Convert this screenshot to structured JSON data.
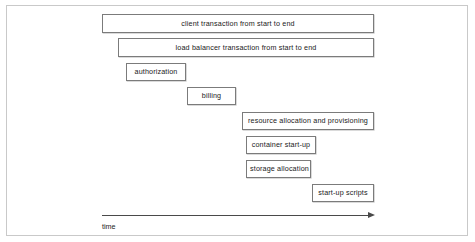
{
  "figure": {
    "type": "gantt-timeline",
    "background_color": "#ffffff",
    "frame_color": "#c9c9c9",
    "bar_border_color": "#7b7b7b",
    "bar_fill_color": "#ffffff",
    "text_color": "#1a1a1a",
    "axis_color": "#4a4a4a"
  },
  "chart_data": {
    "type": "bar",
    "orientation": "horizontal",
    "title": "",
    "xlabel": "time",
    "ylabel": "",
    "grid": false,
    "legend": false,
    "axis": {
      "label": "time",
      "arrow": true,
      "direction": "right",
      "x_start_px": 102,
      "x_end_px": 374,
      "y_px": 215
    },
    "categories": [
      "client transaction from start to end",
      "load balancer transaction from start to end",
      "authorization",
      "billing",
      "resource allocation and provisioning",
      "container start-up",
      "storage allocation",
      "start-up scripts"
    ],
    "bars": [
      {
        "label": "client transaction from start to end",
        "row": 1,
        "start_px": 102,
        "end_px": 374,
        "width_px": 272,
        "top_px": 14,
        "height_px": 19
      },
      {
        "label": "load balancer transaction from start to end",
        "row": 2,
        "start_px": 118,
        "end_px": 374,
        "width_px": 256,
        "top_px": 38,
        "height_px": 19
      },
      {
        "label": "authorization",
        "row": 3,
        "start_px": 126,
        "end_px": 186,
        "width_px": 60,
        "top_px": 63,
        "height_px": 18
      },
      {
        "label": "billing",
        "row": 4,
        "start_px": 187,
        "end_px": 236,
        "width_px": 49,
        "top_px": 87,
        "height_px": 18
      },
      {
        "label": "resource allocation and provisioning",
        "row": 5,
        "start_px": 242,
        "end_px": 374,
        "width_px": 132,
        "top_px": 112,
        "height_px": 18
      },
      {
        "label": "container start-up",
        "row": 6,
        "start_px": 246,
        "end_px": 316,
        "width_px": 70,
        "top_px": 136,
        "height_px": 18
      },
      {
        "label": "storage allocation",
        "row": 7,
        "start_px": 246,
        "end_px": 311,
        "width_px": 65,
        "top_px": 160,
        "height_px": 18
      },
      {
        "label": "start-up scripts",
        "row": 8,
        "start_px": 312,
        "end_px": 374,
        "width_px": 62,
        "top_px": 184,
        "height_px": 18
      }
    ]
  }
}
